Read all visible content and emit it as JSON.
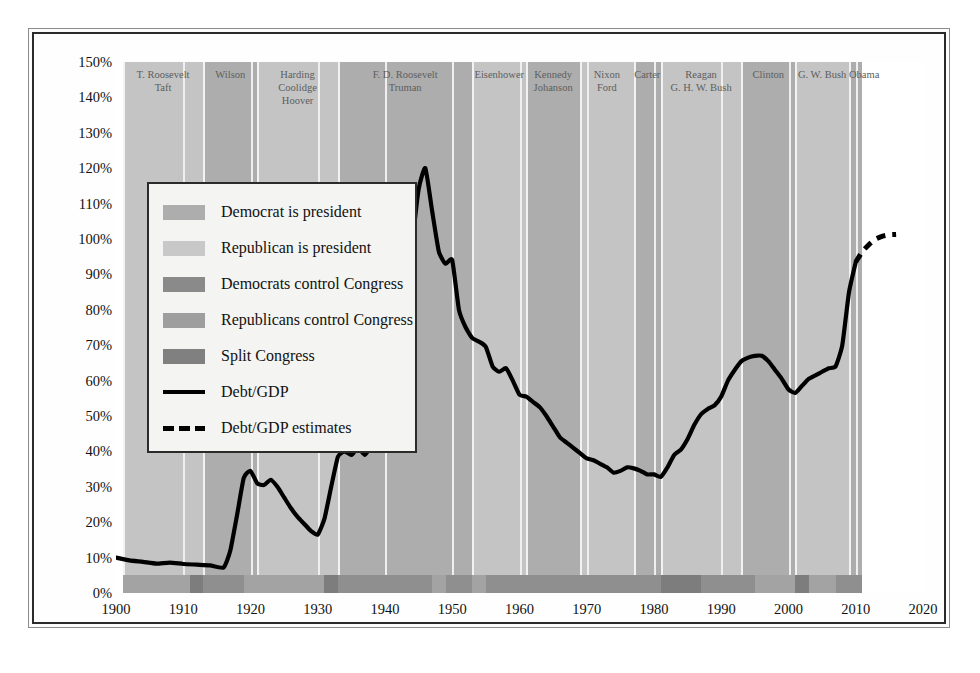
{
  "chart_data": {
    "type": "line",
    "title": "",
    "xlabel": "",
    "ylabel": "",
    "xlim": [
      1900,
      2020
    ],
    "ylim": [
      0,
      150
    ],
    "grid": true,
    "y_tick_labels": [
      "150%",
      "140%",
      "130%",
      "120%",
      "110%",
      "100%",
      "90%",
      "80%",
      "70%",
      "60%",
      "50%",
      "40%",
      "30%",
      "20%",
      "10%",
      "0%"
    ],
    "y_tick_values": [
      150,
      140,
      130,
      120,
      110,
      100,
      90,
      80,
      70,
      60,
      50,
      40,
      30,
      20,
      10,
      0
    ],
    "x_tick_labels": [
      "1900",
      "1910",
      "1920",
      "1930",
      "1940",
      "1950",
      "1960",
      "1970",
      "1980",
      "1990",
      "2000",
      "2010",
      "2020"
    ],
    "x_tick_values": [
      1900,
      1910,
      1920,
      1930,
      1940,
      1950,
      1960,
      1970,
      1980,
      1990,
      2000,
      2010,
      2020
    ],
    "legend_position": "upper-left",
    "series": [
      {
        "name": "Debt/GDP",
        "style": "solid",
        "color": "#000000",
        "x": [
          1900,
          1902,
          1904,
          1906,
          1908,
          1910,
          1912,
          1914,
          1916,
          1917,
          1918,
          1919,
          1920,
          1921,
          1922,
          1923,
          1924,
          1925,
          1926,
          1927,
          1928,
          1929,
          1930,
          1931,
          1932,
          1933,
          1934,
          1935,
          1936,
          1937,
          1938,
          1939,
          1940,
          1941,
          1942,
          1943,
          1944,
          1945,
          1946,
          1947,
          1948,
          1949,
          1950,
          1951,
          1952,
          1953,
          1954,
          1955,
          1956,
          1957,
          1958,
          1959,
          1960,
          1961,
          1962,
          1963,
          1964,
          1965,
          1966,
          1967,
          1968,
          1969,
          1970,
          1971,
          1972,
          1973,
          1974,
          1975,
          1976,
          1977,
          1978,
          1979,
          1980,
          1981,
          1982,
          1983,
          1984,
          1985,
          1986,
          1987,
          1988,
          1989,
          1990,
          1991,
          1992,
          1993,
          1994,
          1995,
          1996,
          1997,
          1998,
          1999,
          2000,
          2001,
          2002,
          2003,
          2004,
          2005,
          2006,
          2007,
          2008,
          2009,
          2010
        ],
        "y": [
          10.0,
          9.2,
          8.8,
          8.3,
          8.6,
          8.2,
          8.0,
          7.8,
          7.2,
          12.0,
          22.0,
          32.5,
          34.5,
          31.0,
          30.5,
          32.0,
          30.0,
          27.0,
          24.0,
          21.5,
          19.5,
          17.5,
          16.5,
          21.0,
          30.0,
          38.5,
          40.0,
          39.0,
          41.0,
          39.0,
          41.5,
          41.0,
          43.0,
          42.0,
          55.0,
          75.0,
          97.0,
          114.0,
          120.0,
          108.0,
          96.5,
          93.0,
          94.0,
          80.0,
          75.0,
          72.0,
          71.0,
          69.5,
          64.0,
          62.5,
          63.5,
          60.0,
          56.0,
          55.5,
          54.0,
          52.5,
          50.0,
          47.0,
          44.0,
          42.5,
          41.0,
          39.5,
          38.0,
          37.5,
          36.5,
          35.5,
          34.0,
          34.5,
          35.5,
          35.2,
          34.5,
          33.5,
          33.5,
          32.8,
          35.5,
          39.0,
          40.5,
          43.5,
          47.5,
          50.5,
          52.0,
          53.0,
          55.5,
          60.0,
          63.0,
          65.5,
          66.5,
          67.0,
          67.0,
          65.5,
          63.0,
          60.5,
          57.5,
          56.5,
          58.5,
          60.5,
          61.5,
          62.5,
          63.5,
          64.0,
          70.0,
          85.0,
          93.5
        ]
      },
      {
        "name": "Debt/GDP estimates",
        "style": "dashed",
        "color": "#000000",
        "x": [
          2010,
          2011,
          2012,
          2013,
          2014,
          2015,
          2016
        ],
        "y": [
          93.5,
          96.5,
          98.5,
          100.0,
          100.8,
          101.2,
          101.3
        ]
      }
    ],
    "president_bands": [
      {
        "label_lines": [
          "T. Roosevelt",
          "Taft"
        ],
        "party": "rep",
        "start": 1901,
        "end": 1913
      },
      {
        "label_lines": [
          "Wilson"
        ],
        "party": "dem",
        "start": 1913,
        "end": 1921
      },
      {
        "label_lines": [
          "Harding",
          "Coolidge",
          "Hoover"
        ],
        "party": "rep",
        "start": 1921,
        "end": 1933
      },
      {
        "label_lines": [
          "F. D. Roosevelt",
          "Truman"
        ],
        "party": "dem",
        "start": 1933,
        "end": 1953
      },
      {
        "label_lines": [
          "Eisenhower"
        ],
        "party": "rep",
        "start": 1953,
        "end": 1961
      },
      {
        "label_lines": [
          "Kennedy",
          "Johanson"
        ],
        "party": "dem",
        "start": 1961,
        "end": 1969
      },
      {
        "label_lines": [
          "Nixon",
          "Ford"
        ],
        "party": "rep",
        "start": 1969,
        "end": 1977
      },
      {
        "label_lines": [
          "Carter"
        ],
        "party": "dem",
        "start": 1977,
        "end": 1981
      },
      {
        "label_lines": [
          "Reagan",
          "G. H. W. Bush"
        ],
        "party": "rep",
        "start": 1981,
        "end": 1993
      },
      {
        "label_lines": [
          "Clinton"
        ],
        "party": "dem",
        "start": 1993,
        "end": 2001
      },
      {
        "label_lines": [
          "G. W. Bush"
        ],
        "party": "rep",
        "start": 2001,
        "end": 2009
      },
      {
        "label_lines": [
          "Obama"
        ],
        "party": "dem",
        "start": 2009,
        "end": 2011
      }
    ],
    "congress_segments": [
      {
        "control": "rep",
        "start": 1901,
        "end": 1911
      },
      {
        "control": "split",
        "start": 1911,
        "end": 1913
      },
      {
        "control": "dem",
        "start": 1913,
        "end": 1919
      },
      {
        "control": "rep",
        "start": 1919,
        "end": 1931
      },
      {
        "control": "split",
        "start": 1931,
        "end": 1933
      },
      {
        "control": "dem",
        "start": 1933,
        "end": 1947
      },
      {
        "control": "rep",
        "start": 1947,
        "end": 1949
      },
      {
        "control": "dem",
        "start": 1949,
        "end": 1953
      },
      {
        "control": "rep",
        "start": 1953,
        "end": 1955
      },
      {
        "control": "dem",
        "start": 1955,
        "end": 1981
      },
      {
        "control": "split",
        "start": 1981,
        "end": 1987
      },
      {
        "control": "dem",
        "start": 1987,
        "end": 1995
      },
      {
        "control": "rep",
        "start": 1995,
        "end": 2001
      },
      {
        "control": "split",
        "start": 2001,
        "end": 2003
      },
      {
        "control": "rep",
        "start": 2003,
        "end": 2007
      },
      {
        "control": "dem",
        "start": 2007,
        "end": 2011
      }
    ]
  },
  "legend": {
    "items": [
      {
        "swatch": "dem-pres",
        "kind": "swatch",
        "label": "Democrat is president"
      },
      {
        "swatch": "rep-pres",
        "kind": "swatch",
        "label": "Republican is president"
      },
      {
        "swatch": "dem-cong",
        "kind": "swatch",
        "label": "Democrats control Congress"
      },
      {
        "swatch": "rep-cong",
        "kind": "swatch",
        "label": "Republicans control Congress"
      },
      {
        "swatch": "split-cong",
        "kind": "swatch",
        "label": "Split Congress"
      },
      {
        "swatch": "",
        "kind": "line",
        "label": "Debt/GDP"
      },
      {
        "swatch": "",
        "kind": "dashed",
        "label": "Debt/GDP estimates"
      }
    ]
  },
  "colors": {
    "democrat_president": "#adadad",
    "republican_president": "#c4c4c4",
    "democrat_congress": "#8f8f8f",
    "republican_congress": "#a3a3a3",
    "split_congress": "#7d7d7d",
    "series_line": "#000000",
    "gridline": "#efefef",
    "frame": "#2b2b2b"
  }
}
